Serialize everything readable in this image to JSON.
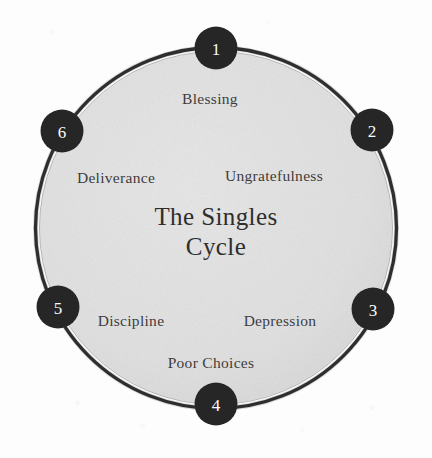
{
  "diagram": {
    "title_line1": "The Singles",
    "title_line2": "Cycle",
    "shape": "circular-cycle",
    "colors": {
      "page_background": "#fdfdfd",
      "wheel_fill": "#e2e2e2",
      "wheel_ring": "#272727",
      "node_fill": "#262626",
      "node_number": "#fafafa",
      "label_text": "#3b3b3b",
      "title_text": "#2e2e2e"
    },
    "geometry": {
      "center_x": 216,
      "center_y": 228,
      "ring_radius": 181,
      "node_radius": 21
    },
    "nodes": [
      {
        "number": "1",
        "label": "Blessing",
        "angle_deg": 0,
        "cx": 216,
        "cy": 48,
        "label_x": 210,
        "label_y": 99
      },
      {
        "number": "2",
        "label": "Ungratefulness",
        "angle_deg": 60,
        "cx": 372,
        "cy": 130,
        "label_x": 274,
        "label_y": 176
      },
      {
        "number": "3",
        "label": "Depression",
        "angle_deg": 120,
        "cx": 373,
        "cy": 309,
        "label_x": 280,
        "label_y": 321
      },
      {
        "number": "4",
        "label": "Poor Choices",
        "angle_deg": 180,
        "cx": 216,
        "cy": 404,
        "label_x": 211,
        "label_y": 363
      },
      {
        "number": "5",
        "label": "Discipline",
        "angle_deg": 240,
        "cx": 58,
        "cy": 307,
        "label_x": 131,
        "label_y": 321
      },
      {
        "number": "6",
        "label": "Deliverance",
        "angle_deg": 300,
        "cx": 62,
        "cy": 131,
        "label_x": 116,
        "label_y": 178
      }
    ]
  }
}
